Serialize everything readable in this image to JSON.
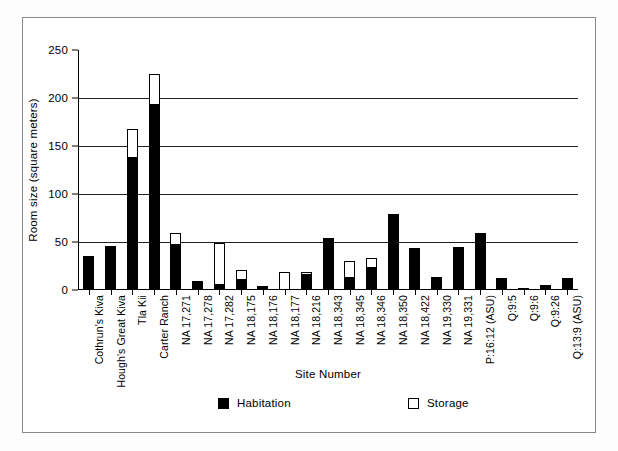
{
  "chart_data": {
    "type": "bar",
    "title": "",
    "xlabel": "Site Number",
    "ylabel": "Room size (square meters)",
    "ylim": [
      0,
      250
    ],
    "yticks": [
      0,
      50,
      100,
      150,
      200,
      250
    ],
    "grid": "horizontal",
    "stacked": true,
    "legend_position": "bottom",
    "categories": [
      "Cothrun's Kiva",
      "Hough's Great Kiva",
      "Tla Kii",
      "Carter Ranch",
      "NA 17,271",
      "NA 17,278",
      "NA 17,282",
      "NA 18,175",
      "NA 18,176",
      "NA 18,177",
      "NA 18,216",
      "NA 18,343",
      "NA 18,345",
      "NA 18,346",
      "NA 18,350",
      "NA 18,422",
      "NA 19,330",
      "NA 19,331",
      "P:16:12 (ASU)",
      "Q:9:5",
      "Q:9:6",
      "Q:9:26",
      "Q:13:9 (ASU)"
    ],
    "series": [
      {
        "name": "Habitation",
        "color": "#000000",
        "values": [
          35,
          46,
          137,
          193,
          47,
          9,
          5,
          10,
          4,
          0,
          16,
          54,
          12,
          23,
          79,
          44,
          14,
          45,
          59,
          13,
          2,
          5,
          13
        ]
      },
      {
        "name": "Storage",
        "color": "#ffffff",
        "values": [
          0,
          0,
          31,
          32,
          12,
          0,
          44,
          11,
          0,
          19,
          3,
          0,
          18,
          10,
          0,
          0,
          0,
          0,
          0,
          0,
          0,
          0,
          0
        ]
      }
    ],
    "totals": [
      35,
      46,
      168,
      225,
      59,
      9,
      49,
      21,
      4,
      19,
      19,
      54,
      30,
      33,
      79,
      44,
      14,
      45,
      59,
      13,
      2,
      5,
      13
    ]
  },
  "legend": {
    "items": [
      {
        "label": "Habitation",
        "swatch": "filled"
      },
      {
        "label": "Storage",
        "swatch": "hollow"
      }
    ]
  },
  "axis": {
    "y_title": "Room size (square meters)",
    "x_title": "Site Number",
    "y_tick_labels": [
      "0",
      "50",
      "100",
      "150",
      "200",
      "250"
    ]
  }
}
